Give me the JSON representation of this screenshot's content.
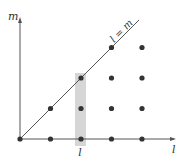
{
  "diagram": {
    "axes": {
      "x_label": "l",
      "y_label": "m"
    },
    "diagonal_label": "l = m",
    "highlight_column_label": "l",
    "highlight_column_index": 2,
    "colors": {
      "axis": "#555555",
      "point": "#333333",
      "highlight": "#d6d6d6",
      "line": "#555555"
    },
    "points": [
      {
        "l": 0,
        "m": 0
      },
      {
        "l": 1,
        "m": 0
      },
      {
        "l": 2,
        "m": 0
      },
      {
        "l": 3,
        "m": 0
      },
      {
        "l": 4,
        "m": 0
      },
      {
        "l": 1,
        "m": 1
      },
      {
        "l": 2,
        "m": 1
      },
      {
        "l": 3,
        "m": 1
      },
      {
        "l": 4,
        "m": 1
      },
      {
        "l": 2,
        "m": 2
      },
      {
        "l": 3,
        "m": 2
      },
      {
        "l": 4,
        "m": 2
      },
      {
        "l": 3,
        "m": 3
      },
      {
        "l": 4,
        "m": 3
      }
    ]
  }
}
